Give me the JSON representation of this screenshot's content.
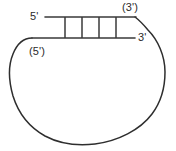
{
  "figure": {
    "background_color": "#ffffff",
    "line_color": "#3a3a3a"
  },
  "labels": {
    "five_prime": "5'",
    "three_prime_parenthetical": "(3')",
    "three_prime": "3'",
    "five_prime_parenthetical": "(5')"
  },
  "structure": {
    "duplex": {
      "top_strand_y": 17,
      "bottom_strand_y": 38,
      "top_strand_x_start": 45,
      "top_strand_x_end": 135,
      "bottom_strand_x_start": 32,
      "bottom_strand_x_end": 134,
      "rung_count": 4,
      "rung_x_positions": [
        65,
        82,
        99,
        116
      ]
    },
    "loop": {
      "left_x": 11,
      "right_x": 165,
      "bottom_y": 144
    }
  }
}
